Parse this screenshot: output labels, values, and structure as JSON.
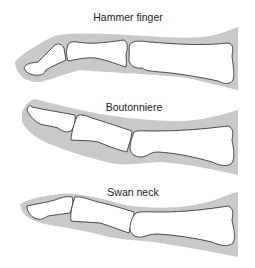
{
  "figure": {
    "panels": [
      {
        "id": "hammer",
        "label": "Hammer finger"
      },
      {
        "id": "boutonniere",
        "label": "Boutonniere"
      },
      {
        "id": "swan",
        "label": "Swan neck"
      }
    ]
  },
  "colors": {
    "soft_tissue": "#c9c9c9",
    "bone_fill": "#ffffff",
    "bone_outline": "#3a3a3a",
    "text": "#1a1a1a"
  }
}
